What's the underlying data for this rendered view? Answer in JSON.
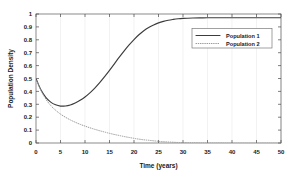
{
  "chart_data": {
    "type": "line",
    "title": "",
    "xlabel": "Time (years)",
    "ylabel": "Population Density",
    "xlim": [
      0,
      50
    ],
    "ylim": [
      0,
      1
    ],
    "xticks": [
      0,
      5,
      10,
      15,
      20,
      25,
      30,
      35,
      40,
      45,
      50
    ],
    "xtick_labels": [
      "0",
      "5",
      "10",
      "15",
      "20",
      "25",
      "30",
      "35",
      "40",
      "45",
      "50"
    ],
    "yticks": [
      0,
      0.1,
      0.2,
      0.3,
      0.4,
      0.5,
      0.6,
      0.7,
      0.8,
      0.9,
      1
    ],
    "ytick_labels": [
      "0",
      "0.1",
      "0.2",
      "0.3",
      "0.4",
      "0.5",
      "0.6",
      "0.7",
      "0.8",
      "0.9",
      "1"
    ],
    "grid": true,
    "grid_axis": "x",
    "legend_position": "upper-right-inside",
    "series": [
      {
        "name": "Population 1",
        "style": "solid",
        "color": "#3c3c3c",
        "x": [
          0,
          1,
          2,
          3,
          4,
          5,
          6,
          7,
          8,
          9,
          10,
          11,
          12,
          13,
          14,
          15,
          16,
          17,
          18,
          19,
          20,
          21,
          22,
          23,
          24,
          25,
          26,
          27,
          28,
          29,
          30,
          32,
          34,
          36,
          38,
          40,
          42,
          44,
          46,
          48,
          50
        ],
        "values": [
          0.5,
          0.412,
          0.354,
          0.317,
          0.296,
          0.286,
          0.287,
          0.295,
          0.31,
          0.331,
          0.357,
          0.389,
          0.426,
          0.468,
          0.514,
          0.563,
          0.614,
          0.665,
          0.714,
          0.76,
          0.802,
          0.839,
          0.87,
          0.895,
          0.915,
          0.931,
          0.943,
          0.952,
          0.958,
          0.963,
          0.966,
          0.969,
          0.97,
          0.971,
          0.971,
          0.971,
          0.971,
          0.971,
          0.971,
          0.971,
          0.971
        ]
      },
      {
        "name": "Population 2",
        "style": "dotted",
        "color": "#9a9a9a",
        "x": [
          0,
          1,
          2,
          3,
          4,
          5,
          6,
          7,
          8,
          9,
          10,
          11,
          12,
          13,
          14,
          15,
          16,
          17,
          18,
          19,
          20,
          21,
          22,
          23,
          24,
          25,
          26,
          27,
          28,
          29,
          30,
          32,
          34,
          36,
          38,
          40,
          42,
          44,
          46,
          48,
          50
        ],
        "values": [
          0.5,
          0.408,
          0.341,
          0.291,
          0.254,
          0.224,
          0.2,
          0.179,
          0.161,
          0.145,
          0.131,
          0.118,
          0.106,
          0.095,
          0.085,
          0.075,
          0.066,
          0.058,
          0.05,
          0.043,
          0.036,
          0.03,
          0.025,
          0.021,
          0.017,
          0.013,
          0.01,
          0.008,
          0.006,
          0.004,
          0.003,
          0.001,
          0.0,
          -0.001,
          -0.001,
          -0.002,
          -0.002,
          -0.002,
          -0.002,
          -0.002,
          -0.002
        ]
      }
    ]
  },
  "legend": {
    "entries": [
      {
        "label": "Population 1"
      },
      {
        "label": "Population 2"
      }
    ]
  }
}
